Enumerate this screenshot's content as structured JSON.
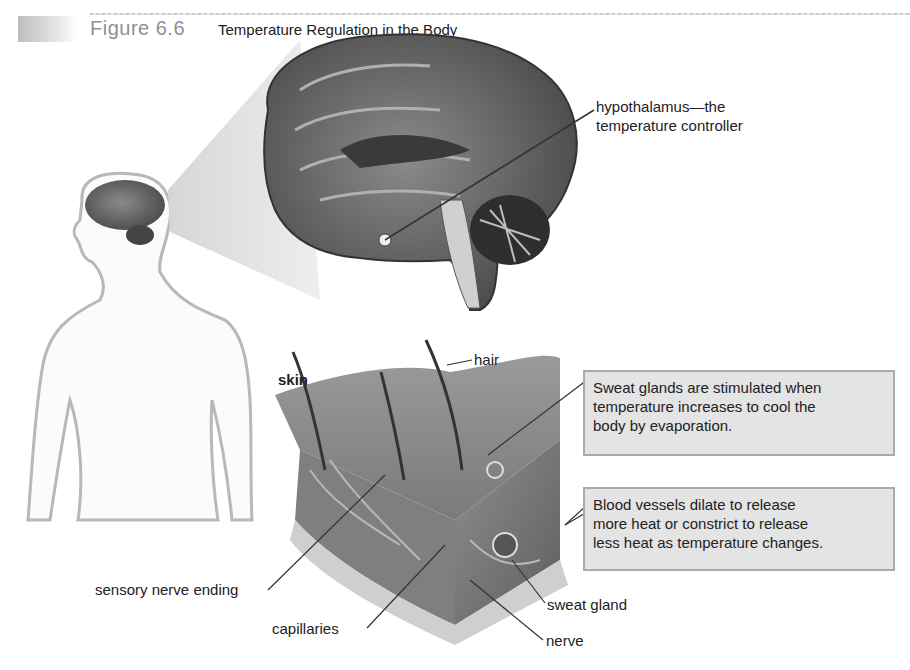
{
  "figure": {
    "number": "Figure 6.6",
    "title": "Temperature Regulation in the Body"
  },
  "labels": {
    "hypothalamus_line1": "hypothalamus—the",
    "hypothalamus_line2": "temperature controller",
    "skin": "skin",
    "hair": "hair",
    "sensory_nerve_ending": "sensory nerve ending",
    "capillaries": "capillaries",
    "sweat_gland": "sweat gland",
    "nerve": "nerve"
  },
  "callouts": {
    "sweat_glands": {
      "line1": "Sweat glands are stimulated when",
      "line2": "temperature increases to cool the",
      "line3": "body by evaporation."
    },
    "blood_vessels": {
      "line1": "Blood vessels dilate to release",
      "line2": "more heat or constrict to release",
      "line3": "less heat as temperature changes."
    }
  },
  "icons": [
    "human-silhouette",
    "brain-sagittal",
    "skin-cross-section"
  ]
}
